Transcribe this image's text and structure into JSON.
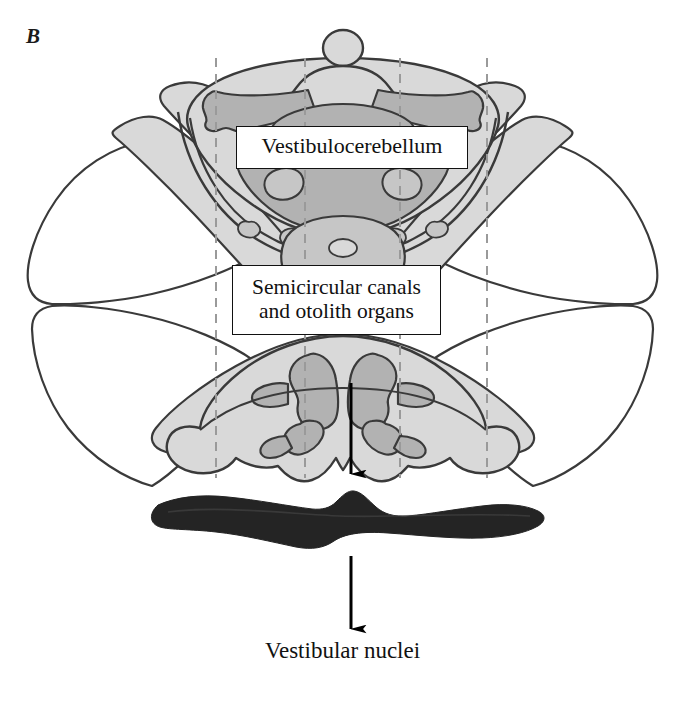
{
  "figure": {
    "panel_letter": "B",
    "background_color": "#ffffff",
    "width": 685,
    "height": 703
  },
  "callouts": [
    {
      "id": "vestibulocerebellum",
      "text": "Vestibulocerebellum"
    },
    {
      "id": "semicircular-canals",
      "line1": "Semicircular canals",
      "line2": "and otolith organs"
    }
  ],
  "caption": {
    "vestibular_nuclei": "Vestibular nuclei"
  },
  "colors": {
    "outline": "#3a3a3a",
    "outline_dark": "#2b2b2b",
    "fill_white": "#ffffff",
    "fill_light_gray": "#d9d9d9",
    "fill_mid_gray": "#c6c6c6",
    "fill_dark_gray": "#b2b2b2",
    "vestibular_nuclei_band": "#242424",
    "dashed_guide": "#9a9a9a",
    "arrow": "#000000",
    "text": "#111111",
    "callout_border": "#111111"
  },
  "guides": {
    "dashed_line_x_positions": [
      216,
      305,
      400,
      487
    ],
    "dashed_line_y_top": 58,
    "dashed_line_y_bottom": 478
  },
  "arrows": [
    {
      "id": "cerebellum-to-nuclei",
      "x": 351,
      "y_start": 383,
      "y_end": 475
    },
    {
      "id": "nuclei-to-label",
      "x": 351,
      "y_start": 556,
      "y_end": 630
    }
  ],
  "structures": {
    "apex_nodule": "small-circle-top-center",
    "outer_hemispheres": "white-lateral-cerebellar-hemispheres",
    "vermis_lobes": "light-gray-paramedian-lobes",
    "flocculonodular": "dark-gray-inner-lobules",
    "vestibular_nuclei_band": "dark-horizontal-wavy-band"
  }
}
